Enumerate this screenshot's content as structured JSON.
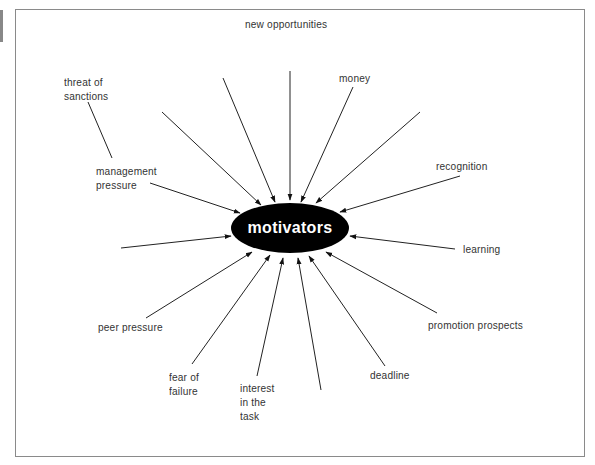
{
  "diagram": {
    "center": {
      "label": "motivators",
      "fill": "#000000",
      "text_color": "#ffffff"
    },
    "labels": [
      {
        "id": "new-opportunities",
        "text": "new opportunities",
        "x": 245,
        "y": 17
      },
      {
        "id": "threat-of-sanctions",
        "text": "threat of\nsanctions",
        "x": 64,
        "y": 75
      },
      {
        "id": "money",
        "text": "money",
        "x": 339,
        "y": 71
      },
      {
        "id": "management-pressure",
        "text": "management\npressure",
        "x": 96,
        "y": 164
      },
      {
        "id": "recognition",
        "text": "recognition",
        "x": 436,
        "y": 159
      },
      {
        "id": "learning",
        "text": "learning",
        "x": 463,
        "y": 242
      },
      {
        "id": "peer-pressure",
        "text": "peer pressure",
        "x": 98,
        "y": 320
      },
      {
        "id": "promotion-prospects",
        "text": "promotion prospects",
        "x": 428,
        "y": 318
      },
      {
        "id": "deadline",
        "text": "deadline",
        "x": 370,
        "y": 368
      },
      {
        "id": "fear-of-failure",
        "text": "fear of\nfailure",
        "x": 169,
        "y": 370
      },
      {
        "id": "interest-in-the-task",
        "text": "interest\nin the\ntask",
        "x": 240,
        "y": 381
      }
    ],
    "arrows": [
      {
        "from": [
          290,
          71
        ],
        "to": [
          290,
          200
        ]
      },
      {
        "from": [
          223,
          78
        ],
        "to": [
          275,
          202
        ]
      },
      {
        "from": [
          162,
          112
        ],
        "to": [
          261,
          205
        ]
      },
      {
        "from": [
          150,
          183
        ],
        "to": [
          240,
          213
        ]
      },
      {
        "from": [
          353,
          87
        ],
        "to": [
          301,
          202
        ]
      },
      {
        "from": [
          420,
          112
        ],
        "to": [
          316,
          203
        ]
      },
      {
        "from": [
          460,
          176
        ],
        "to": [
          340,
          212
        ]
      },
      {
        "from": [
          455,
          249
        ],
        "to": [
          350,
          236
        ]
      },
      {
        "from": [
          121,
          248
        ],
        "to": [
          231,
          236
        ]
      },
      {
        "from": [
          146,
          318
        ],
        "to": [
          252,
          252
        ]
      },
      {
        "from": [
          192,
          364
        ],
        "to": [
          270,
          255
        ]
      },
      {
        "from": [
          257,
          376
        ],
        "to": [
          283,
          258
        ]
      },
      {
        "from": [
          321,
          390
        ],
        "to": [
          298,
          258
        ]
      },
      {
        "from": [
          385,
          366
        ],
        "to": [
          309,
          256
        ]
      },
      {
        "from": [
          437,
          313
        ],
        "to": [
          326,
          252
        ]
      }
    ],
    "connector_lines": [
      {
        "from": [
          88,
          102
        ],
        "to": [
          112,
          158
        ]
      }
    ]
  }
}
